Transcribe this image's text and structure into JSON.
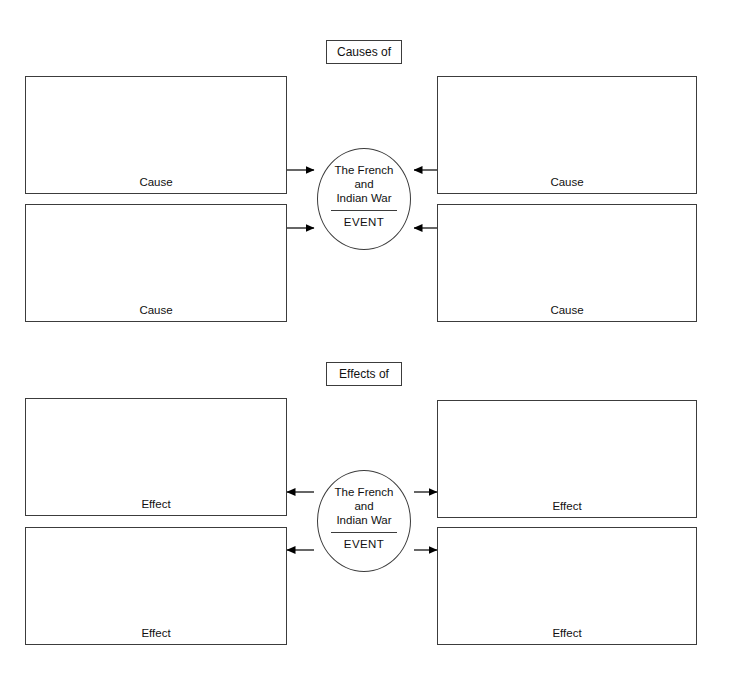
{
  "page": {
    "background_color": "#ffffff",
    "line_color": "#3c3c3c",
    "text_color": "#111111"
  },
  "sections": [
    {
      "id": "causes",
      "header_label": "Causes of",
      "flow_direction": "inward",
      "center": {
        "title_line_1": "The French",
        "title_line_2": "and",
        "title_line_3": "Indian War",
        "type_label": "EVENT"
      },
      "boxes": [
        {
          "position": "top-left",
          "label": "Cause",
          "value": ""
        },
        {
          "position": "top-right",
          "label": "Cause",
          "value": ""
        },
        {
          "position": "bottom-left",
          "label": "Cause",
          "value": ""
        },
        {
          "position": "bottom-right",
          "label": "Cause",
          "value": ""
        }
      ]
    },
    {
      "id": "effects",
      "header_label": "Effects of",
      "flow_direction": "outward",
      "center": {
        "title_line_1": "The French",
        "title_line_2": "and",
        "title_line_3": "Indian War",
        "type_label": "EVENT"
      },
      "boxes": [
        {
          "position": "top-left",
          "label": "Effect",
          "value": ""
        },
        {
          "position": "top-right",
          "label": "Effect",
          "value": ""
        },
        {
          "position": "bottom-left",
          "label": "Effect",
          "value": ""
        },
        {
          "position": "bottom-right",
          "label": "Effect",
          "value": ""
        }
      ]
    }
  ],
  "connectors": {
    "causes": [
      {
        "name": "connector-cause-top-left-to-event",
        "direction": "right"
      },
      {
        "name": "connector-cause-bottom-left-to-event",
        "direction": "right"
      },
      {
        "name": "connector-cause-top-right-to-event",
        "direction": "left"
      },
      {
        "name": "connector-cause-bottom-right-to-event",
        "direction": "left"
      }
    ],
    "effects": [
      {
        "name": "connector-event-to-effect-top-left",
        "direction": "left"
      },
      {
        "name": "connector-event-to-effect-bottom-left",
        "direction": "left"
      },
      {
        "name": "connector-event-to-effect-top-right",
        "direction": "right"
      },
      {
        "name": "connector-event-to-effect-bottom-right",
        "direction": "right"
      }
    ]
  }
}
